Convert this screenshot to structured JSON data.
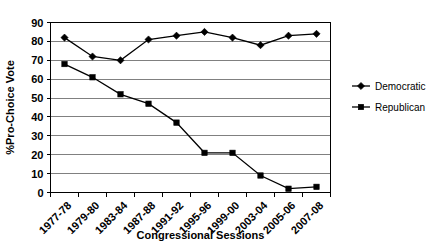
{
  "chart_data": {
    "type": "line",
    "title": "",
    "xlabel": "Congressional Sessions",
    "ylabel": "%Pro-Choice Vote",
    "ylim": [
      0,
      90
    ],
    "ytick_step": 10,
    "yticks": [
      "0",
      "10",
      "20",
      "30",
      "40",
      "50",
      "60",
      "70",
      "80",
      "90"
    ],
    "grid": "horizontal",
    "legend_position": "right",
    "categories": [
      "1977-78",
      "1979-80",
      "1983-84",
      "1987-88",
      "1991-92",
      "1995-96",
      "1999-00",
      "2003-04",
      "2005-06",
      "2007-08"
    ],
    "series": [
      {
        "name": "Democratic",
        "marker": "diamond",
        "color": "#000000",
        "values": [
          82,
          72,
          70,
          81,
          83,
          85,
          82,
          78,
          83,
          84
        ]
      },
      {
        "name": "Republican",
        "marker": "square",
        "color": "#000000",
        "values": [
          68,
          61,
          52,
          47,
          37,
          21,
          21,
          9,
          2,
          3
        ]
      }
    ]
  },
  "legend": {
    "entries": [
      {
        "label": "Democratic"
      },
      {
        "label": "Republican"
      }
    ]
  }
}
